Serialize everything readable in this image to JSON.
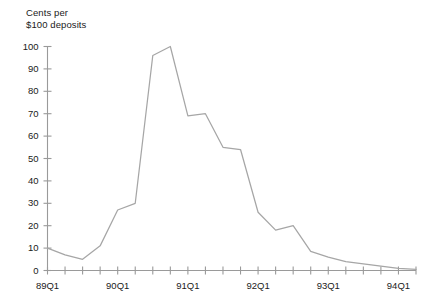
{
  "chart_data": {
    "type": "line",
    "title": "",
    "ylabel": "Cents per\n$100 deposits",
    "xlabel": "",
    "ylim": [
      0,
      100
    ],
    "ytick_values": [
      0,
      10,
      20,
      30,
      40,
      50,
      60,
      70,
      80,
      90,
      100
    ],
    "ytick_labels": [
      "0",
      "10",
      "20",
      "30",
      "40",
      "50",
      "60",
      "70",
      "80",
      "90",
      "100"
    ],
    "grid": false,
    "legend": null,
    "legend_position": "none",
    "line_color": "#a6a6a6",
    "axis_color": "#9a9a9a",
    "x": [
      "89Q1",
      "89Q2",
      "89Q3",
      "89Q4",
      "90Q1",
      "90Q2",
      "90Q3",
      "90Q4",
      "91Q1",
      "91Q2",
      "91Q3",
      "91Q4",
      "92Q1",
      "92Q2",
      "92Q3",
      "92Q4",
      "93Q1",
      "93Q2",
      "93Q3",
      "93Q4",
      "94Q1",
      "94Q2"
    ],
    "xtick_labels_shown": [
      "89Q1",
      "90Q1",
      "91Q1",
      "92Q1",
      "93Q1",
      "94Q1"
    ],
    "xtick_label_every": 4,
    "values": [
      10,
      7,
      5,
      11,
      27,
      30,
      96,
      100,
      69,
      70,
      55,
      54,
      26,
      18,
      20,
      8.5,
      6,
      4,
      3,
      2,
      1,
      0.5
    ],
    "series": [
      {
        "name": "Cents per $100 deposits",
        "values": [
          10,
          7,
          5,
          11,
          27,
          30,
          96,
          100,
          69,
          70,
          55,
          54,
          26,
          18,
          20,
          8.5,
          6,
          4,
          3,
          2,
          1,
          0.5
        ]
      }
    ],
    "peak": {
      "x": "90Q4",
      "y": 100
    },
    "minimum": {
      "x": "94Q2",
      "y": 0.5
    }
  }
}
